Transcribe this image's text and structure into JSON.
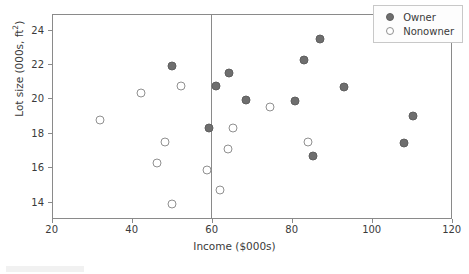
{
  "chart_data": {
    "type": "scatter",
    "title": "",
    "xlabel": "Income ($000s)",
    "ylabel": "Lot size (000s, ft²)",
    "xlim": [
      20,
      120
    ],
    "ylim": [
      13.0,
      24.9
    ],
    "xticks": [
      20,
      40,
      60,
      80,
      100,
      120
    ],
    "yticks": [
      14,
      16,
      18,
      20,
      22,
      24
    ],
    "grid": false,
    "legend_position": "top-right",
    "annotations": [
      {
        "type": "vertical-line",
        "x": 59.5,
        "label": ""
      }
    ],
    "series": [
      {
        "name": "Owner",
        "marker": "filled-circle",
        "color": "#6e6e6e",
        "points": [
          {
            "x": 49.8,
            "y": 21.95
          },
          {
            "x": 60.8,
            "y": 20.75
          },
          {
            "x": 64.2,
            "y": 21.55
          },
          {
            "x": 68.4,
            "y": 19.95
          },
          {
            "x": 59.2,
            "y": 18.35
          },
          {
            "x": 80.6,
            "y": 19.9
          },
          {
            "x": 82.8,
            "y": 22.3
          },
          {
            "x": 86.8,
            "y": 23.5
          },
          {
            "x": 85.2,
            "y": 16.7
          },
          {
            "x": 92.8,
            "y": 20.7
          },
          {
            "x": 107.9,
            "y": 17.45
          },
          {
            "x": 110.0,
            "y": 19.05
          }
        ]
      },
      {
        "name": "Nonowner",
        "marker": "open-circle",
        "color": "#909090",
        "points": [
          {
            "x": 31.8,
            "y": 18.8
          },
          {
            "x": 42.0,
            "y": 20.35
          },
          {
            "x": 46.0,
            "y": 16.3
          },
          {
            "x": 48.2,
            "y": 17.55
          },
          {
            "x": 49.8,
            "y": 13.95
          },
          {
            "x": 52.0,
            "y": 20.75
          },
          {
            "x": 58.5,
            "y": 15.9
          },
          {
            "x": 61.9,
            "y": 14.75
          },
          {
            "x": 63.8,
            "y": 17.1
          },
          {
            "x": 65.0,
            "y": 18.35
          },
          {
            "x": 74.3,
            "y": 19.55
          },
          {
            "x": 83.8,
            "y": 17.5
          }
        ]
      }
    ]
  },
  "legend": {
    "entries": [
      {
        "label": "Owner"
      },
      {
        "label": "Nonowner"
      }
    ]
  },
  "axes": {
    "x_tick_labels": [
      "20",
      "40",
      "60",
      "80",
      "100",
      "120"
    ],
    "y_tick_labels": [
      "14",
      "16",
      "18",
      "20",
      "22",
      "24"
    ],
    "x_title": "Income ($000s)",
    "y_title_main": "Lot size (000s, ft",
    "y_title_sup": "2",
    "y_title_close": ")"
  },
  "colors": {
    "owner_fill": "#6e6e6e",
    "nonowner_stroke": "#909090",
    "axis": "#8a8a8a",
    "text": "#3a3a3a",
    "background": "#ffffff"
  }
}
